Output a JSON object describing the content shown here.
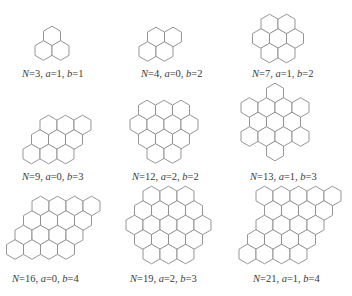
{
  "diagram": {
    "colors": {
      "stroke": "#8a8a8a",
      "fill": "#ffffff",
      "text": "#3a3a3a"
    },
    "hex_radius": 9.8,
    "clusters": [
      {
        "id": "n3",
        "label": {
          "N": "3",
          "a": "1",
          "b": "1"
        },
        "label_pos": [
          22,
          77
        ],
        "rows": [
          {
            "y": 36,
            "x": [
              52
            ]
          },
          {
            "y": 50.5,
            "x": [
              43.5,
              60.5
            ]
          }
        ]
      },
      {
        "id": "n4",
        "label": {
          "N": "4",
          "a": "0",
          "b": "2"
        },
        "label_pos": [
          141,
          77
        ],
        "rows": [
          {
            "y": 37,
            "x": [
              156,
              173
            ]
          },
          {
            "y": 51.5,
            "x": [
              147.5,
              164.5
            ]
          }
        ]
      },
      {
        "id": "n7",
        "label": {
          "N": "7",
          "a": "1",
          "b": "2"
        },
        "label_pos": [
          252,
          77
        ],
        "rows": [
          {
            "y": 24,
            "x": [
              269.5,
              286.5
            ]
          },
          {
            "y": 38.5,
            "x": [
              261,
              278,
              295
            ]
          },
          {
            "y": 53,
            "x": [
              269.5,
              286.5
            ]
          }
        ]
      },
      {
        "id": "n9",
        "label": {
          "N": "9",
          "a": "0",
          "b": "3"
        },
        "label_pos": [
          22,
          180
        ],
        "rows": [
          {
            "y": 125,
            "x": [
              48.5,
              65.5,
              82.5
            ]
          },
          {
            "y": 139.5,
            "x": [
              40,
              57,
              74
            ]
          },
          {
            "y": 154,
            "x": [
              31.5,
              48.5,
              65.5
            ]
          }
        ]
      },
      {
        "id": "n12",
        "label": {
          "N": "12",
          "a": "2",
          "b": "2"
        },
        "label_pos": [
          132,
          180
        ],
        "rows": [
          {
            "y": 110,
            "x": [
              147,
              164,
              181
            ]
          },
          {
            "y": 124.5,
            "x": [
              138.5,
              155.5,
              172.5,
              189.5
            ]
          },
          {
            "y": 139,
            "x": [
              147,
              164,
              181
            ]
          },
          {
            "y": 153.5,
            "x": [
              155.5,
              172.5
            ]
          }
        ]
      },
      {
        "id": "n13",
        "label": {
          "N": "13",
          "a": "1",
          "b": "3"
        },
        "label_pos": [
          250,
          180
        ],
        "rows": [
          {
            "y": 93,
            "x": [
              275
            ]
          },
          {
            "y": 107.5,
            "x": [
              249.5,
              266.5,
              283.5,
              300.5
            ]
          },
          {
            "y": 122,
            "x": [
              258,
              275,
              292
            ]
          },
          {
            "y": 136.5,
            "x": [
              249.5,
              266.5,
              283.5,
              300.5
            ]
          },
          {
            "y": 151,
            "x": [
              275
            ]
          }
        ]
      },
      {
        "id": "n16",
        "label": {
          "N": "16",
          "a": "0",
          "b": "4"
        },
        "label_pos": [
          12,
          282
        ],
        "rows": [
          {
            "y": 206,
            "x": [
              40.5,
              57.5,
              74.5,
              91.5
            ]
          },
          {
            "y": 220.5,
            "x": [
              32,
              49,
              66,
              83
            ]
          },
          {
            "y": 235,
            "x": [
              23.5,
              40.5,
              57.5,
              74.5
            ]
          },
          {
            "y": 249.5,
            "x": [
              15,
              32,
              49,
              66
            ]
          }
        ]
      },
      {
        "id": "n19",
        "label": {
          "N": "19",
          "a": "2",
          "b": "3"
        },
        "label_pos": [
          130,
          282
        ],
        "rows": [
          {
            "y": 196,
            "x": [
              151.5,
              168.5,
              185.5
            ]
          },
          {
            "y": 210.5,
            "x": [
              143,
              160,
              177,
              194
            ]
          },
          {
            "y": 225,
            "x": [
              134.5,
              151.5,
              168.5,
              185.5,
              202.5
            ]
          },
          {
            "y": 239.5,
            "x": [
              143,
              160,
              177,
              194
            ]
          },
          {
            "y": 254,
            "x": [
              151.5,
              168.5,
              185.5
            ]
          }
        ]
      },
      {
        "id": "n21",
        "label": {
          "N": "21",
          "a": "1",
          "b": "4"
        },
        "label_pos": [
          253,
          282
        ],
        "rows": [
          {
            "y": 196,
            "x": [
              264.5,
              281.5,
              298.5,
              315.5,
              332.5
            ]
          },
          {
            "y": 210.5,
            "x": [
              273,
              290,
              307,
              324
            ]
          },
          {
            "y": 225,
            "x": [
              264.5,
              281.5,
              298.5,
              315.5
            ]
          },
          {
            "y": 239.5,
            "x": [
              256,
              273,
              290,
              307
            ]
          },
          {
            "y": 254,
            "x": [
              247.5,
              264.5,
              281.5,
              298.5
            ]
          }
        ]
      }
    ],
    "label_format": {
      "n_var": "N",
      "a_var": "a",
      "b_var": "b",
      "eq": "=",
      "sep": ", "
    }
  }
}
